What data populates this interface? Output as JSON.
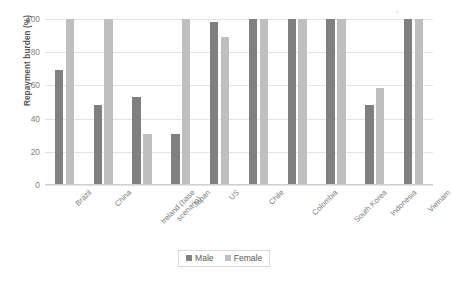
{
  "chart_data": {
    "type": "bar",
    "title": "",
    "xlabel": "",
    "ylabel": "Repayment burden (%)",
    "ylim": [
      0,
      100
    ],
    "yticks": [
      0,
      20,
      40,
      60,
      80,
      100
    ],
    "ytick_labels": [
      "0",
      "20",
      "40",
      "60",
      "80",
      "100"
    ],
    "grid": true,
    "legend_position": "bottom-center",
    "categories": [
      "Brazil",
      "China",
      "Ireland (base scenario)",
      "Japan",
      "US",
      "Chile",
      "Colombia",
      "South Korea",
      "Indonesia",
      "Vietnam"
    ],
    "category_lines": [
      [
        "Brazil"
      ],
      [
        "China"
      ],
      [
        "Ireland (base",
        "scenario)"
      ],
      [
        "Japan"
      ],
      [
        "US"
      ],
      [
        "Chile"
      ],
      [
        "Colombia"
      ],
      [
        "South Korea"
      ],
      [
        "Indonesia"
      ],
      [
        "Vietnam"
      ]
    ],
    "series": [
      {
        "name": "Male",
        "color": "#808080",
        "values": [
          69,
          48.5,
          53,
          31,
          98,
          100,
          100,
          100,
          48,
          100
        ]
      },
      {
        "name": "Female",
        "color": "#bfbfbf",
        "values": [
          100,
          100,
          30.5,
          100,
          89,
          100,
          100,
          100,
          58.5,
          100
        ]
      }
    ]
  },
  "legend": {
    "entries": [
      {
        "label": "Male"
      },
      {
        "label": "Female"
      }
    ]
  },
  "colors": {
    "male": "#808080",
    "female": "#bfbfbf",
    "gridline": "#e4e4e4",
    "text": "#7f7f7f",
    "axis_title": "#595959"
  }
}
